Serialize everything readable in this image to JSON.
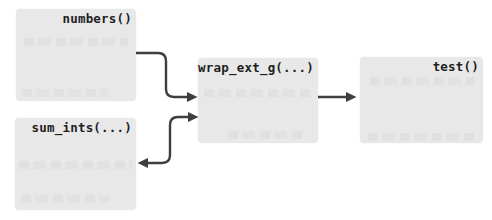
{
  "diagram": {
    "type": "call-graph",
    "colors": {
      "background": "#ffffff",
      "node_fill": "#e8e8e8",
      "label_text": "#1f1f1f",
      "arrow": "#3e3e3e"
    },
    "nodes": [
      {
        "id": "numbers",
        "label": "numbers()"
      },
      {
        "id": "sum_ints",
        "label": "sum_ints(...)"
      },
      {
        "id": "wrap_ext_g",
        "label": "wrap_ext_g(...)"
      },
      {
        "id": "test",
        "label": "test()"
      }
    ],
    "edges": [
      {
        "from": "numbers()",
        "to": "wrap_ext_g(...)",
        "arrowheads": "to",
        "shape": "elbow-right-down-right"
      },
      {
        "from": "wrap_ext_g(...)",
        "to": "sum_ints(...)",
        "arrowheads": "both",
        "shape": "s-curve"
      },
      {
        "from": "wrap_ext_g(...)",
        "to": "test()",
        "arrowheads": "to",
        "shape": "straight"
      }
    ]
  }
}
